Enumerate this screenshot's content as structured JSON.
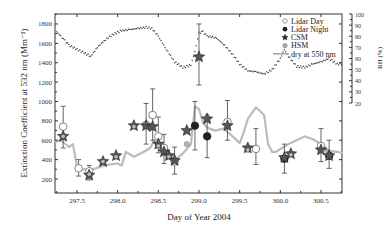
{
  "chart_data": {
    "type": "scatter",
    "title": "",
    "xlabel": "Day of Year 2004",
    "ylabel": "Extinction Coefficient at 532 nm (Mm⁻¹)",
    "y2label": "RH (%)",
    "xlim": [
      297.23,
      300.77
    ],
    "ylim": [
      50,
      1900
    ],
    "y2lim": [
      10,
      100
    ],
    "x_ticks": [
      "297.5",
      "298.0",
      "298.5",
      "299.0",
      "299.5",
      "300.0",
      "300.5"
    ],
    "y_ticks": [
      "200",
      "400",
      "600",
      "800",
      "1000",
      "1200",
      "1400",
      "1600",
      "1800"
    ],
    "y2_ticks": [
      "20",
      "30",
      "40",
      "50",
      "60",
      "70",
      "80",
      "90",
      "100"
    ],
    "legend": [
      "Lidar Day",
      "Lidar Night",
      "CSM",
      "HSM",
      "dry at 550 nm"
    ],
    "legend_position": "upper right",
    "series": [
      {
        "name": "Lidar Day",
        "marker": "open-circle",
        "points": [
          {
            "x": 297.33,
            "y": 740,
            "err": [
              520,
              950
            ]
          },
          {
            "x": 297.52,
            "y": 310,
            "err": [
              230,
              400
            ]
          },
          {
            "x": 297.65,
            "y": 280,
            "err": [
              190,
              340
            ]
          },
          {
            "x": 298.35,
            "y": 760,
            "err": [
              560,
              980
            ]
          },
          {
            "x": 298.43,
            "y": 860,
            "err": [
              600,
              1130
            ]
          },
          {
            "x": 298.5,
            "y": 640,
            "err": [
              470,
              840
            ]
          },
          {
            "x": 298.57,
            "y": 520,
            "err": [
              360,
              660
            ]
          },
          {
            "x": 298.7,
            "y": 380,
            "err": [
              250,
              530
            ]
          },
          {
            "x": 299.35,
            "y": 790,
            "err": [
              600,
              1010
            ]
          },
          {
            "x": 299.7,
            "y": 510,
            "err": [
              350,
              720
            ]
          },
          {
            "x": 300.5,
            "y": 540,
            "err": [
              380,
              720
            ]
          }
        ]
      },
      {
        "name": "Lidar Night",
        "marker": "filled-circle",
        "points": [
          {
            "x": 298.95,
            "y": 750,
            "err": [
              500,
              1000
            ]
          },
          {
            "x": 299.1,
            "y": 640,
            "err": [
              420,
              860
            ]
          },
          {
            "x": 300.05,
            "y": 410,
            "err": [
              260,
              560
            ]
          },
          {
            "x": 300.6,
            "y": 440,
            "err": [
              310,
              600
            ]
          }
        ]
      },
      {
        "name": "CSM",
        "marker": "star",
        "points": [
          {
            "x": 297.33,
            "y": 640
          },
          {
            "x": 297.65,
            "y": 240
          },
          {
            "x": 297.82,
            "y": 380
          },
          {
            "x": 297.98,
            "y": 440
          },
          {
            "x": 298.2,
            "y": 750
          },
          {
            "x": 298.35,
            "y": 750
          },
          {
            "x": 298.43,
            "y": 740
          },
          {
            "x": 298.5,
            "y": 560
          },
          {
            "x": 298.57,
            "y": 480
          },
          {
            "x": 298.63,
            "y": 440
          },
          {
            "x": 298.7,
            "y": 390
          },
          {
            "x": 298.85,
            "y": 700
          },
          {
            "x": 299.0,
            "y": 1460,
            "err": [
              1170,
              1800
            ]
          },
          {
            "x": 299.1,
            "y": 820
          },
          {
            "x": 299.35,
            "y": 750
          },
          {
            "x": 299.6,
            "y": 520
          },
          {
            "x": 300.05,
            "y": 420
          },
          {
            "x": 300.13,
            "y": 460
          },
          {
            "x": 300.5,
            "y": 500
          },
          {
            "x": 300.6,
            "y": 440
          }
        ]
      },
      {
        "name": "HSM",
        "marker": "gray-circle",
        "points": [
          {
            "x": 297.33,
            "y": 640
          },
          {
            "x": 297.65,
            "y": 250
          },
          {
            "x": 297.82,
            "y": 380
          },
          {
            "x": 297.98,
            "y": 430
          },
          {
            "x": 298.2,
            "y": 740
          },
          {
            "x": 298.5,
            "y": 540
          },
          {
            "x": 298.63,
            "y": 430
          },
          {
            "x": 298.85,
            "y": 560
          },
          {
            "x": 299.6,
            "y": 500
          },
          {
            "x": 300.13,
            "y": 450
          },
          {
            "x": 300.55,
            "y": 480
          }
        ]
      },
      {
        "name": "dry at 550 nm",
        "type": "line",
        "color": "#bbbbbb",
        "x": [
          297.23,
          297.3,
          297.4,
          297.45,
          297.5,
          297.55,
          297.7,
          297.8,
          297.9,
          298.0,
          298.05,
          298.1,
          298.2,
          298.3,
          298.4,
          298.45,
          298.5,
          298.6,
          298.7,
          298.8,
          298.9,
          298.95,
          299.0,
          299.05,
          299.1,
          299.2,
          299.3,
          299.4,
          299.5,
          299.55,
          299.6,
          299.7,
          299.8,
          299.85,
          299.9,
          299.95,
          300.0,
          300.1,
          300.2,
          300.3,
          300.4,
          300.5,
          300.6,
          300.7,
          300.77
        ],
        "y": [
          580,
          600,
          530,
          560,
          330,
          300,
          300,
          330,
          350,
          360,
          340,
          480,
          430,
          470,
          520,
          600,
          520,
          460,
          400,
          460,
          560,
          950,
          920,
          780,
          730,
          700,
          720,
          650,
          570,
          680,
          820,
          940,
          860,
          560,
          480,
          480,
          510,
          560,
          600,
          640,
          610,
          560,
          490,
          480,
          470
        ]
      },
      {
        "name": "RH",
        "type": "dotted",
        "axis": "y2",
        "x": [
          297.25,
          297.3,
          297.35,
          297.4,
          297.67,
          297.75,
          297.85,
          297.95,
          298.05,
          298.15,
          298.25,
          298.35,
          298.42,
          298.5,
          298.6,
          298.7,
          298.8,
          298.9,
          298.95,
          299.0,
          299.05,
          299.1,
          299.2,
          299.3,
          299.4,
          299.5,
          299.6,
          299.7,
          299.8,
          299.9,
          300.0,
          300.05,
          300.1,
          300.2,
          300.3,
          300.4,
          300.5,
          300.6,
          300.7,
          300.77
        ],
        "y": [
          84,
          80,
          76,
          72,
          62,
          70,
          77,
          82,
          85,
          86,
          87,
          88,
          87,
          80,
          68,
          57,
          52,
          54,
          66,
          83,
          84,
          80,
          79,
          73,
          65,
          55,
          49,
          48,
          46,
          50,
          60,
          68,
          62,
          53,
          52,
          55,
          57,
          60,
          55,
          55
        ]
      }
    ]
  }
}
